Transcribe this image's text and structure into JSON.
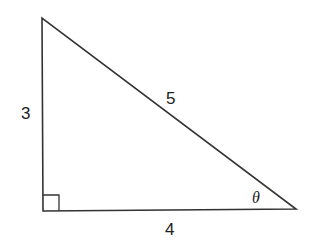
{
  "diagram": {
    "type": "right-triangle",
    "stroke_color": "#333333",
    "vertices": {
      "top": [
        42,
        18
      ],
      "right_angle": [
        43,
        211
      ],
      "acute": [
        296,
        209
      ]
    },
    "labels": {
      "vertical_side": "3",
      "hypotenuse": "5",
      "horizontal_side": "4",
      "angle": "θ"
    },
    "right_angle_marker": true
  }
}
